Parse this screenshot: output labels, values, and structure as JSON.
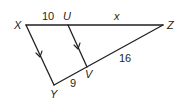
{
  "diagram": {
    "type": "triangle-with-parallel-segment",
    "vertices": {
      "X": {
        "label": "X"
      },
      "Y": {
        "label": "Y"
      },
      "Z": {
        "label": "Z"
      },
      "U": {
        "label": "U"
      },
      "V": {
        "label": "V"
      }
    },
    "segments": [
      {
        "name": "XU",
        "label": "10"
      },
      {
        "name": "UZ",
        "label": "x"
      },
      {
        "name": "YV",
        "label": "9"
      },
      {
        "name": "VZ",
        "label": "16"
      },
      {
        "name": "XY",
        "label": "",
        "parallel_mark": true
      },
      {
        "name": "UV",
        "label": "",
        "parallel_mark": true
      }
    ],
    "colors": {
      "stroke": "#231f20",
      "background": "#ffffff"
    }
  }
}
